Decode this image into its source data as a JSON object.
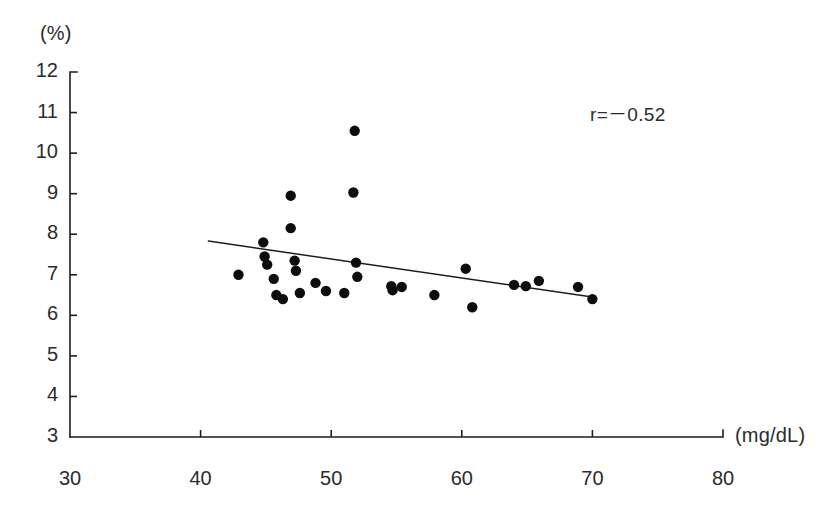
{
  "chart_data": {
    "type": "scatter",
    "title": "",
    "xlabel": "(mg/dL)",
    "ylabel": "(%)",
    "xlim": [
      30,
      80
    ],
    "ylim": [
      3,
      12
    ],
    "xticks": [
      30,
      40,
      50,
      60,
      70,
      80
    ],
    "yticks": [
      3,
      4,
      5,
      6,
      7,
      8,
      9,
      10,
      11,
      12
    ],
    "grid": false,
    "legend": null,
    "annotations": [
      {
        "name": "correlation",
        "text": "r=－0.52",
        "x": 72.5,
        "y": 11.1
      }
    ],
    "series": [
      {
        "name": "observations",
        "marker": "filled-circle",
        "color": "#0d0d0d",
        "points": [
          {
            "x": 42.9,
            "y": 7.0
          },
          {
            "x": 44.8,
            "y": 7.8
          },
          {
            "x": 44.9,
            "y": 7.45
          },
          {
            "x": 45.1,
            "y": 7.25
          },
          {
            "x": 45.6,
            "y": 6.9
          },
          {
            "x": 45.8,
            "y": 6.5
          },
          {
            "x": 46.3,
            "y": 6.4
          },
          {
            "x": 46.9,
            "y": 8.95
          },
          {
            "x": 46.9,
            "y": 8.15
          },
          {
            "x": 47.2,
            "y": 7.35
          },
          {
            "x": 47.3,
            "y": 7.1
          },
          {
            "x": 47.6,
            "y": 6.55
          },
          {
            "x": 48.8,
            "y": 6.8
          },
          {
            "x": 49.6,
            "y": 6.6
          },
          {
            "x": 51.0,
            "y": 6.55
          },
          {
            "x": 51.7,
            "y": 9.03
          },
          {
            "x": 51.8,
            "y": 10.55
          },
          {
            "x": 51.9,
            "y": 7.3
          },
          {
            "x": 52.0,
            "y": 6.95
          },
          {
            "x": 54.6,
            "y": 6.72
          },
          {
            "x": 54.7,
            "y": 6.62
          },
          {
            "x": 55.4,
            "y": 6.7
          },
          {
            "x": 57.9,
            "y": 6.5
          },
          {
            "x": 60.3,
            "y": 7.15
          },
          {
            "x": 60.8,
            "y": 6.2
          },
          {
            "x": 64.0,
            "y": 6.75
          },
          {
            "x": 64.9,
            "y": 6.72
          },
          {
            "x": 65.9,
            "y": 6.85
          },
          {
            "x": 68.9,
            "y": 6.7
          },
          {
            "x": 70.0,
            "y": 6.4
          }
        ]
      }
    ],
    "fit_line": {
      "name": "regression-line",
      "x_start": 40.6,
      "y_start": 7.83,
      "x_end": 70.0,
      "y_end": 6.45
    }
  },
  "axes": {
    "y_unit": "(%)",
    "x_unit": "(mg/dL)",
    "y_tick_labels": [
      "12",
      "11",
      "10",
      "9",
      "8",
      "7",
      "6",
      "5",
      "4",
      "3"
    ],
    "x_tick_labels": [
      "30",
      "40",
      "50",
      "60",
      "70",
      "80"
    ]
  }
}
